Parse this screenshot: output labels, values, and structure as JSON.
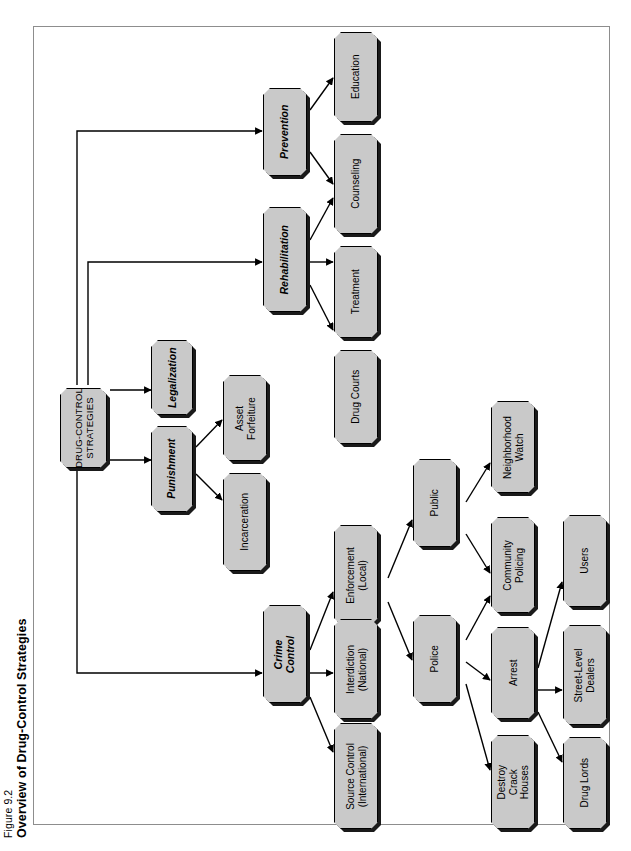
{
  "figure": {
    "number": "Figure 9.2",
    "title": "Overview of Drug-Control Strategies"
  },
  "colors": {
    "node_fill": "#c9c9c9",
    "node_border": "#000000",
    "node_shadow": "#1a1a1a",
    "frame_border": "#8d8d8d",
    "background": "#ffffff",
    "edge": "#000000"
  },
  "diagram": {
    "orientation": "rotated-90-ccw",
    "root": "DRUG-CONTROL STRATEGIES",
    "nodes": [
      {
        "id": "root",
        "label": "DRUG-CONTROL\nSTRATEGIES",
        "style": "root"
      },
      {
        "id": "crime",
        "label": "Crime\nControl",
        "style": "italic"
      },
      {
        "id": "punishment",
        "label": "Punishment",
        "style": "italic"
      },
      {
        "id": "legalization",
        "label": "Legalization",
        "style": "italic"
      },
      {
        "id": "rehab",
        "label": "Rehabilitation",
        "style": "italic"
      },
      {
        "id": "prevention",
        "label": "Prevention",
        "style": "italic"
      },
      {
        "id": "education",
        "label": "Education",
        "style": "plain"
      },
      {
        "id": "counseling",
        "label": "Counseling",
        "style": "plain"
      },
      {
        "id": "treatment",
        "label": "Treatment",
        "style": "plain"
      },
      {
        "id": "drugcourts",
        "label": "Drug Courts",
        "style": "plain"
      },
      {
        "id": "assetforf",
        "label": "Asset\nForfeiture",
        "style": "plain"
      },
      {
        "id": "incarceration",
        "label": "Incarceration",
        "style": "plain"
      },
      {
        "id": "enforcement",
        "label": "Enforcement\n(Local)",
        "style": "plain"
      },
      {
        "id": "interdiction",
        "label": "Interdiction\n(National)",
        "style": "plain"
      },
      {
        "id": "sourcecontrol",
        "label": "Source Control\n(International)",
        "style": "plain"
      },
      {
        "id": "public",
        "label": "Public",
        "style": "plain"
      },
      {
        "id": "police",
        "label": "Police",
        "style": "plain"
      },
      {
        "id": "neighborhood",
        "label": "Neighborhood\nWatch",
        "style": "plain"
      },
      {
        "id": "commpolicing",
        "label": "Community\nPolicing",
        "style": "plain"
      },
      {
        "id": "arrest",
        "label": "Arrest",
        "style": "plain"
      },
      {
        "id": "destroycrack",
        "label": "Destroy\nCrack\nHouses",
        "style": "plain"
      },
      {
        "id": "users",
        "label": "Users",
        "style": "plain"
      },
      {
        "id": "streetdealers",
        "label": "Street-Level\nDealers",
        "style": "plain"
      },
      {
        "id": "druglords",
        "label": "Drug Lords",
        "style": "plain"
      }
    ],
    "edges": [
      {
        "from": "root",
        "to": "prevention"
      },
      {
        "from": "root",
        "to": "rehab"
      },
      {
        "from": "root",
        "to": "legalization"
      },
      {
        "from": "root",
        "to": "punishment"
      },
      {
        "from": "root",
        "to": "crime"
      },
      {
        "from": "prevention",
        "to": "education"
      },
      {
        "from": "prevention",
        "to": "counseling"
      },
      {
        "from": "rehab",
        "to": "counseling"
      },
      {
        "from": "rehab",
        "to": "treatment"
      },
      {
        "from": "rehab",
        "to": "drugcourts"
      },
      {
        "from": "punishment",
        "to": "assetforf"
      },
      {
        "from": "punishment",
        "to": "incarceration"
      },
      {
        "from": "crime",
        "to": "enforcement"
      },
      {
        "from": "crime",
        "to": "interdiction"
      },
      {
        "from": "crime",
        "to": "sourcecontrol"
      },
      {
        "from": "enforcement",
        "to": "public"
      },
      {
        "from": "enforcement",
        "to": "police"
      },
      {
        "from": "public",
        "to": "neighborhood"
      },
      {
        "from": "public",
        "to": "commpolicing"
      },
      {
        "from": "police",
        "to": "commpolicing"
      },
      {
        "from": "police",
        "to": "arrest"
      },
      {
        "from": "police",
        "to": "destroycrack"
      },
      {
        "from": "arrest",
        "to": "users"
      },
      {
        "from": "arrest",
        "to": "streetdealers"
      },
      {
        "from": "arrest",
        "to": "druglords"
      }
    ]
  }
}
